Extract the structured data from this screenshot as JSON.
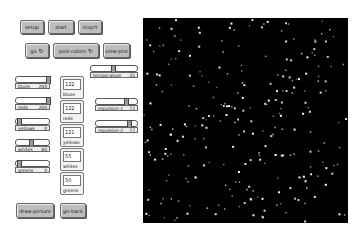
{
  "buttons_row1": [
    {
      "label": "setup"
    },
    {
      "label": "start"
    },
    {
      "label": "stop!t"
    }
  ],
  "buttons_row2": [
    {
      "label": "go",
      "icon": "forever-icon"
    },
    {
      "label": "pick-colors",
      "icon": "forever-icon"
    },
    {
      "label": "view-plot"
    }
  ],
  "forever_glyph": "↻",
  "sliders_left": [
    {
      "name": "blues",
      "value": "200",
      "pos": 0.95
    },
    {
      "name": "reds",
      "value": "200",
      "pos": 0.95
    },
    {
      "name": "yellows",
      "value": "0",
      "pos": 0.02
    },
    {
      "name": "whites",
      "value": "80",
      "pos": 0.4
    },
    {
      "name": "greens",
      "value": "0",
      "pos": 0.02
    }
  ],
  "monitors": [
    {
      "name": "blues",
      "value": "122"
    },
    {
      "name": "reds",
      "value": "122"
    },
    {
      "name": "yellows",
      "value": "121"
    },
    {
      "name": "whites",
      "value": "55"
    },
    {
      "name": "greens",
      "value": "50"
    }
  ],
  "temperature": {
    "name": "temperature",
    "value": "35",
    "pos": 0.45
  },
  "repulsion_1": {
    "name": "repulsion-1",
    "value": "72",
    "pos": 0.72
  },
  "repulsion_2": {
    "name": "repulsion-2",
    "value": "77",
    "pos": 0.77
  },
  "bottom_buttons": [
    {
      "label": "draw-picture"
    },
    {
      "label": "go-back"
    }
  ],
  "world": {
    "background": "#000000",
    "dot_color": "#ffffff"
  }
}
